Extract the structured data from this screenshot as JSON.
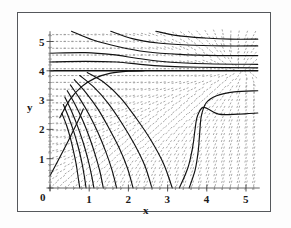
{
  "figure": {
    "kind": "phase-portrait",
    "frame_color": "#55585c",
    "background": "#ffffff"
  },
  "chart_data": {
    "type": "line",
    "title": "",
    "xlabel": "x",
    "ylabel": "y",
    "xlim": [
      0,
      5.3
    ],
    "ylim": [
      0,
      5.35
    ],
    "grid": false,
    "legend": null,
    "xticks": [
      0,
      1,
      2,
      3,
      4,
      5
    ],
    "xtick_labels": [
      "0",
      "1",
      "2",
      "3",
      "4",
      "5"
    ],
    "yticks": [
      0,
      1,
      2,
      3,
      4,
      5
    ],
    "ytick_labels": [
      "0",
      "1",
      "2",
      "3",
      "4",
      "5"
    ],
    "minor_ticks_per_major": 5,
    "axis_style": "crossed-at-origin-with-ticks",
    "annotations": [
      {
        "text": "saddle separatrix at y = 4",
        "x": 2.2,
        "y": 4.0
      },
      {
        "text": "vertical separatrix near x = 3.8",
        "x": 3.8,
        "y": 1.5
      }
    ],
    "vector_field": {
      "style": "dashed-segments",
      "color": "#8c8c8c",
      "nx": 26,
      "ny": 22,
      "description": "short dashed direction-field strokes tangent to the flow"
    },
    "series": [
      {
        "name": "streamline-1",
        "comment": "lower-left fan, steep",
        "points": [
          [
            0.3,
            2.55
          ],
          [
            0.42,
            2.15
          ],
          [
            0.52,
            1.7
          ],
          [
            0.6,
            1.25
          ],
          [
            0.67,
            0.8
          ],
          [
            0.72,
            0.35
          ],
          [
            0.76,
            0.0
          ]
        ]
      },
      {
        "name": "streamline-2",
        "points": [
          [
            0.34,
            2.85
          ],
          [
            0.48,
            2.4
          ],
          [
            0.6,
            1.95
          ],
          [
            0.71,
            1.45
          ],
          [
            0.8,
            0.95
          ],
          [
            0.87,
            0.45
          ],
          [
            0.92,
            0.0
          ]
        ]
      },
      {
        "name": "streamline-3",
        "points": [
          [
            0.38,
            3.1
          ],
          [
            0.55,
            2.62
          ],
          [
            0.7,
            2.12
          ],
          [
            0.84,
            1.58
          ],
          [
            0.96,
            1.02
          ],
          [
            1.05,
            0.5
          ],
          [
            1.12,
            0.0
          ]
        ]
      },
      {
        "name": "streamline-4",
        "points": [
          [
            0.44,
            3.32
          ],
          [
            0.64,
            2.85
          ],
          [
            0.83,
            2.32
          ],
          [
            1.0,
            1.75
          ],
          [
            1.15,
            1.15
          ],
          [
            1.27,
            0.58
          ],
          [
            1.36,
            0.0
          ]
        ]
      },
      {
        "name": "streamline-5",
        "points": [
          [
            0.52,
            3.52
          ],
          [
            0.76,
            3.05
          ],
          [
            1.0,
            2.5
          ],
          [
            1.22,
            1.9
          ],
          [
            1.42,
            1.25
          ],
          [
            1.58,
            0.62
          ],
          [
            1.7,
            0.0
          ]
        ]
      },
      {
        "name": "streamline-6",
        "points": [
          [
            0.62,
            3.7
          ],
          [
            0.92,
            3.25
          ],
          [
            1.22,
            2.7
          ],
          [
            1.5,
            2.05
          ],
          [
            1.76,
            1.38
          ],
          [
            1.97,
            0.7
          ],
          [
            2.12,
            0.0
          ]
        ]
      },
      {
        "name": "streamline-7",
        "points": [
          [
            0.76,
            3.84
          ],
          [
            1.12,
            3.44
          ],
          [
            1.48,
            2.9
          ],
          [
            1.83,
            2.22
          ],
          [
            2.15,
            1.5
          ],
          [
            2.42,
            0.76
          ],
          [
            2.6,
            0.0
          ]
        ]
      },
      {
        "name": "streamline-8",
        "points": [
          [
            0.95,
            3.94
          ],
          [
            1.38,
            3.6
          ],
          [
            1.8,
            3.08
          ],
          [
            2.2,
            2.38
          ],
          [
            2.58,
            1.62
          ],
          [
            2.9,
            0.82
          ],
          [
            3.12,
            0.0
          ]
        ]
      },
      {
        "name": "separatrix-y4",
        "comment": "horizontal line y = 4 across full width",
        "points": [
          [
            0.0,
            4.0
          ],
          [
            1.0,
            4.0
          ],
          [
            2.0,
            4.0
          ],
          [
            3.0,
            4.0
          ],
          [
            4.0,
            4.0
          ],
          [
            5.3,
            4.0
          ]
        ]
      },
      {
        "name": "incoming-left-to-saddle",
        "points": [
          [
            0.25,
            2.4
          ],
          [
            0.5,
            3.0
          ],
          [
            0.8,
            3.45
          ],
          [
            1.15,
            3.75
          ],
          [
            1.55,
            3.92
          ],
          [
            2.0,
            3.99
          ],
          [
            2.4,
            4.0
          ]
        ]
      },
      {
        "name": "streamline-upper-1",
        "points": [
          [
            0.0,
            4.3
          ],
          [
            0.9,
            4.32
          ],
          [
            1.7,
            4.3
          ],
          [
            2.3,
            4.22
          ],
          [
            2.9,
            4.16
          ],
          [
            3.8,
            4.12
          ],
          [
            5.3,
            4.1
          ]
        ]
      },
      {
        "name": "streamline-upper-2",
        "points": [
          [
            0.0,
            4.6
          ],
          [
            0.9,
            4.62
          ],
          [
            1.6,
            4.55
          ],
          [
            2.25,
            4.42
          ],
          [
            3.0,
            4.3
          ],
          [
            4.0,
            4.24
          ],
          [
            5.3,
            4.22
          ]
        ]
      },
      {
        "name": "streamline-upper-3",
        "points": [
          [
            0.55,
            5.35
          ],
          [
            1.1,
            5.05
          ],
          [
            1.75,
            4.82
          ],
          [
            2.45,
            4.65
          ],
          [
            3.3,
            4.56
          ],
          [
            4.3,
            4.52
          ],
          [
            5.3,
            4.52
          ]
        ]
      },
      {
        "name": "streamline-upper-4",
        "points": [
          [
            1.55,
            5.35
          ],
          [
            2.1,
            5.1
          ],
          [
            2.75,
            4.95
          ],
          [
            3.5,
            4.88
          ],
          [
            4.4,
            4.85
          ],
          [
            5.3,
            4.85
          ]
        ]
      },
      {
        "name": "streamline-upper-5",
        "points": [
          [
            2.7,
            5.35
          ],
          [
            3.25,
            5.2
          ],
          [
            3.95,
            5.12
          ],
          [
            4.6,
            5.08
          ],
          [
            5.3,
            5.08
          ]
        ]
      },
      {
        "name": "streamline-right-1",
        "points": [
          [
            3.55,
            0.0
          ],
          [
            3.7,
            0.6
          ],
          [
            3.78,
            1.25
          ],
          [
            3.82,
            1.9
          ],
          [
            3.86,
            2.45
          ],
          [
            3.98,
            2.9
          ],
          [
            4.25,
            3.15
          ],
          [
            4.7,
            3.28
          ],
          [
            5.3,
            3.32
          ]
        ]
      },
      {
        "name": "streamline-right-2",
        "points": [
          [
            3.3,
            0.0
          ],
          [
            3.52,
            0.7
          ],
          [
            3.64,
            1.4
          ],
          [
            3.7,
            2.0
          ],
          [
            3.76,
            2.45
          ],
          [
            3.92,
            2.75
          ],
          [
            4.3,
            2.52
          ],
          [
            4.8,
            2.52
          ],
          [
            5.3,
            2.56
          ]
        ]
      },
      {
        "name": "ray-from-origin",
        "comment": "straight diagonal through lower left",
        "points": [
          [
            0.0,
            0.42
          ],
          [
            0.25,
            1.05
          ],
          [
            0.5,
            1.7
          ],
          [
            0.72,
            2.3
          ],
          [
            0.85,
            2.7
          ]
        ]
      }
    ]
  },
  "axes": {
    "x_label": "x",
    "y_label": "y",
    "x_tick_labels": [
      "0",
      "1",
      "2",
      "3",
      "4",
      "5"
    ],
    "y_tick_labels": [
      "0",
      "1",
      "2",
      "3",
      "4",
      "5"
    ]
  }
}
